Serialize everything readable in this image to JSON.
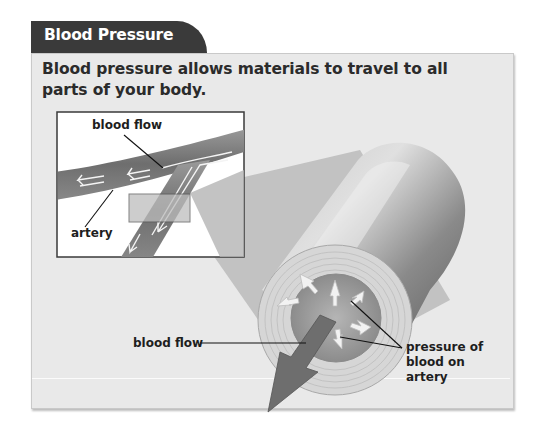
{
  "header": {
    "title": "Blood Pressure"
  },
  "caption": "Blood pressure allows materials to travel to all parts of your body.",
  "inset": {
    "labels": {
      "blood_flow": "blood flow",
      "artery": "artery"
    }
  },
  "cross_section": {
    "labels": {
      "blood_flow": "blood flow",
      "pressure_line1": "pressure of",
      "pressure_line2": "blood on",
      "pressure_line3": "artery"
    }
  },
  "colors": {
    "tab_bg": "#3a3a3a",
    "panel_bg": "#e9e9e9",
    "artery_gray": "#7a7a7a",
    "arrow_fill": "#f2f2f2"
  }
}
